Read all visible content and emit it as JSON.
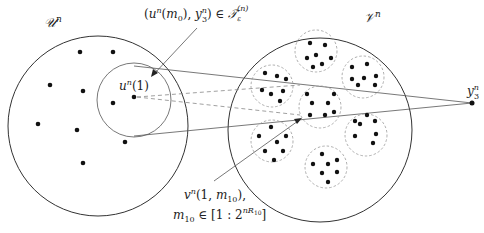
{
  "figure": {
    "sets": {
      "u": {
        "label": "𝒰",
        "sup": "n"
      },
      "v": {
        "label": "𝒱",
        "sup": "n"
      }
    },
    "points": {
      "u1": {
        "base": "u",
        "sup": "n",
        "arg": "(1)"
      },
      "y3": {
        "base": "y",
        "sup": "n",
        "sub": "3"
      }
    },
    "annotations": {
      "top": {
        "open": "(",
        "u": "u",
        "u_sup": "n",
        "u_arg_open": "(",
        "m": "m",
        "m_sub": "0",
        "u_arg_close": "),",
        "y": " y",
        "y_sup": "n",
        "y_sub": "3",
        "close": ")",
        "in": " ∈ ",
        "T": "𝒯",
        "T_sub": "ε",
        "T_sup": "(n)"
      },
      "bottom_line1": {
        "v": "v",
        "v_sup": "n",
        "args": "(1, ",
        "m": "m",
        "m_sub": "10",
        "tail": "),"
      },
      "bottom_line2": {
        "m": "m",
        "m_sub": "10",
        "in": " ∈ [1 : 2",
        "exp": "nR",
        "exp_sub": "10",
        "close": "]"
      }
    },
    "colors": {
      "stroke": "#333333",
      "dashed": "#999999",
      "dot": "#111111"
    }
  }
}
